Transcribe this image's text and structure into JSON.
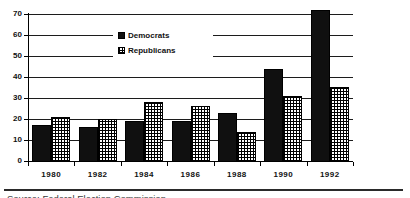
{
  "chart_data": {
    "type": "bar",
    "title": "",
    "xlabel": "",
    "ylabel": "",
    "categories": [
      "1980",
      "1982",
      "1984",
      "1986",
      "1988",
      "1990",
      "1992"
    ],
    "series": [
      {
        "name": "Democrats",
        "pattern": "solid-black",
        "values": [
          17,
          16,
          19,
          19,
          23,
          44,
          72
        ]
      },
      {
        "name": "Republicans",
        "pattern": "checkered",
        "values": [
          21,
          20,
          28,
          26,
          14,
          31,
          35
        ]
      }
    ],
    "ylim": [
      0,
      70
    ],
    "yticks": [
      0,
      10,
      20,
      30,
      40,
      50,
      60,
      70
    ],
    "grid": true,
    "legend_position": "inside-top-center"
  },
  "colors": {
    "democrat_bar": "#101010",
    "republican_bar_background": "#ffffff",
    "axis_and_grid": "#1c1c1c",
    "background": "#ffffff"
  },
  "footer": {
    "source_text": "Source: Federal Election Commission"
  }
}
